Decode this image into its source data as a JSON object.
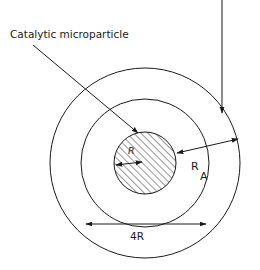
{
  "diagram": {
    "type": "concentric-circles",
    "labels": {
      "particle_label": "Catalytic microparticle",
      "inner_radius": "R",
      "annulus_radius_main": "R",
      "annulus_radius_sub": "A",
      "diameter": "4R"
    },
    "circles": [
      {
        "name": "catalytic-microparticle",
        "cx": 145,
        "cy": 163,
        "r": 31,
        "hatched": true
      },
      {
        "name": "middle-boundary",
        "cx": 145,
        "cy": 163,
        "r": 64,
        "hatched": false
      },
      {
        "name": "outer-boundary",
        "cx": 145,
        "cy": 163,
        "r": 95,
        "hatched": false
      }
    ],
    "colors": {
      "stroke": "#1a1a1a",
      "background": "#ffffff"
    }
  }
}
